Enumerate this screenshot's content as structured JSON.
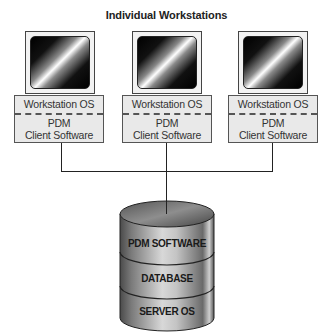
{
  "title": "Individual Workstations",
  "workstations": [
    {
      "os_label": "Workstation OS",
      "client_line1": "PDM",
      "client_line2": "Client Software",
      "screen_icon": "monitor-icon"
    },
    {
      "os_label": "Workstation OS",
      "client_line1": "PDM",
      "client_line2": "Client Software",
      "screen_icon": "monitor-icon"
    },
    {
      "os_label": "Workstation OS",
      "client_line1": "PDM",
      "client_line2": "Client Software",
      "screen_icon": "monitor-icon"
    }
  ],
  "server": {
    "icon": "database-cylinder-icon",
    "layers": [
      "PDM SOFTWARE",
      "DATABASE",
      "SERVER OS"
    ]
  },
  "colors": {
    "line": "#222222",
    "label_box_bg": "#e9e9e9",
    "cylinder_mid": "#9a9a9a"
  }
}
